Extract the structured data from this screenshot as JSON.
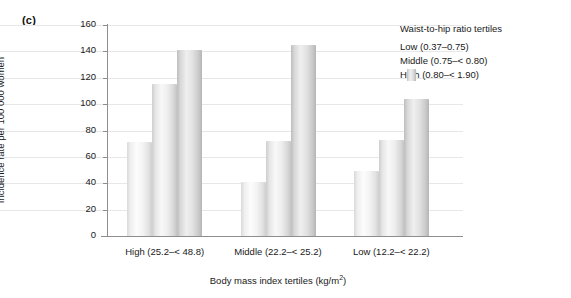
{
  "panel": {
    "label": "(c)"
  },
  "chart_data": {
    "type": "bar",
    "title": "",
    "subtitle": "",
    "xlabel": "Body mass index tertiles (kg/m2)",
    "xlabel_display": "Body mass index tertiles (kg/m",
    "xlabel_sup": "2",
    "xlabel_tail": ")",
    "ylabel": "Incidence rate per 100 000 women",
    "ylim": [
      0,
      160
    ],
    "ytick_step": 20,
    "yticks": [
      "0",
      "20",
      "40",
      "60",
      "80",
      "100",
      "120",
      "140",
      "160"
    ],
    "grid": "horizontal-light",
    "legend_position": "top-right",
    "legend_title": "Waist-to-hip ratio tertiles",
    "categories": [
      "High (25.2–< 48.8)",
      "Middle (22.2–< 25.2)",
      "Low (12.2–< 22.2)"
    ],
    "series": [
      {
        "name": "Low (0.37–0.75)",
        "key": "low",
        "color": "#f2f2f2",
        "values": [
          71,
          41,
          49
        ]
      },
      {
        "name": "Middle (0.75–< 0.80)",
        "key": "middle",
        "color": "#e3e3e3",
        "values": [
          115,
          72,
          73
        ]
      },
      {
        "name": "High (0.80–< 1.90)",
        "key": "high",
        "color": "#d2d2d2",
        "values": [
          141,
          145,
          104
        ]
      }
    ]
  }
}
